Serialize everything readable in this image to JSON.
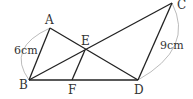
{
  "diagram": {
    "type": "geometry",
    "points": {
      "A": {
        "label": "A",
        "x": 50,
        "y": 28
      },
      "B": {
        "label": "B",
        "x": 29,
        "y": 80
      },
      "C": {
        "label": "C",
        "x": 172,
        "y": 3
      },
      "D": {
        "label": "D",
        "x": 138,
        "y": 80
      },
      "E": {
        "label": "E",
        "x": 85,
        "y": 50
      },
      "F": {
        "label": "F",
        "x": 72,
        "y": 80
      }
    },
    "segments": [
      "AB",
      "AD",
      "BC",
      "BD",
      "CD",
      "EF"
    ],
    "measurements": {
      "AB": "6cm",
      "CD": "9cm"
    },
    "line_color": "#222222",
    "arc_color": "#999999"
  }
}
